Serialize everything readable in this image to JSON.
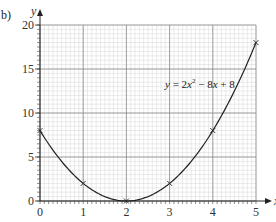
{
  "part_label": "b)",
  "chart_data": {
    "type": "line",
    "title": "",
    "xlabel": "x",
    "ylabel": "y",
    "xlim": [
      0,
      5
    ],
    "ylim": [
      0,
      20
    ],
    "grid": true,
    "x_ticks": [
      0,
      1,
      2,
      3,
      4,
      5
    ],
    "y_ticks": [
      0,
      5,
      10,
      15,
      20
    ],
    "series": [
      {
        "name": "y = 2x² − 8x + 8",
        "equation": "y = 2x^2 - 8x + 8",
        "x": [
          0,
          1,
          2,
          3,
          4,
          5
        ],
        "values": [
          8,
          2,
          0,
          2,
          8,
          18
        ],
        "markers": "x",
        "curve": "smooth"
      }
    ],
    "annotations": [
      {
        "text": "y = 2x² − 8x + 8",
        "x": 2.9,
        "y": 12.5
      }
    ]
  },
  "equation_label": {
    "y": "y",
    "eq": " = 2",
    "x1": "x",
    "sup": "2",
    "rest": " − 8",
    "x2": "x",
    "tail": " + 8"
  },
  "axes": {
    "x_name": "x",
    "y_name": "y"
  },
  "colors": {
    "minor_grid": "#d6d6d6",
    "major_grid": "#8c8c8c",
    "curve": "#222222"
  }
}
